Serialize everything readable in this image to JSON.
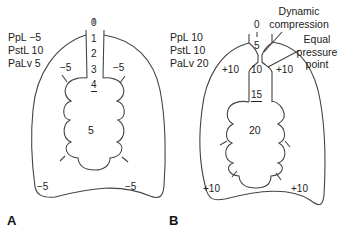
{
  "panel_a": {
    "label": "A",
    "legend": {
      "ppl": "PpL −5",
      "pstl": "PstL  10",
      "palv": "PaLv 5"
    },
    "airway_values": [
      "0",
      "1",
      "2",
      "3",
      "4"
    ],
    "alveolar_pressure": "5",
    "pleural_labels": [
      "−5",
      "−5",
      "−5",
      "−5"
    ]
  },
  "panel_b": {
    "label": "B",
    "legend": {
      "ppl": "PpL  10",
      "pstl": "PstL 10",
      "palv": "PaLv  20"
    },
    "airway_values": [
      "0",
      "5",
      "10",
      "15"
    ],
    "alveolar_pressure": "20",
    "pleural_labels": [
      "+10",
      "+10",
      "+10",
      "+10"
    ],
    "annotations": {
      "dynamic_compression": [
        "Dynamic",
        "compression"
      ],
      "equal_pressure_point": [
        "Equal",
        "pressure",
        "point"
      ]
    }
  }
}
